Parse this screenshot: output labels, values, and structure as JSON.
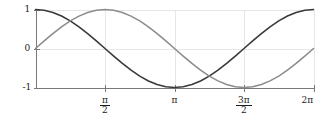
{
  "chart_data": {
    "type": "line",
    "title": "",
    "subtitle": "",
    "xlabel": "",
    "ylabel": "",
    "xlim": [
      0,
      6.283185307179586
    ],
    "ylim": [
      -1,
      1
    ],
    "grid": true,
    "legend": null,
    "x_tick_values": [
      0,
      1.5707963267948966,
      3.141592653589793,
      4.71238898038469,
      6.283185307179586
    ],
    "x_tick_labels": [
      "",
      "π/2",
      "π",
      "3π/2",
      "2π"
    ],
    "y_tick_values": [
      1,
      0,
      -1
    ],
    "y_tick_labels": [
      "1",
      "0",
      "-1"
    ],
    "series": [
      {
        "name": "cos(x)",
        "color": "#3a3a3a",
        "linewidth": 1.6,
        "x": [
          0,
          0.19634954,
          0.39269908,
          0.58904862,
          0.78539816,
          0.9817477,
          1.17809725,
          1.37444679,
          1.57079633,
          1.76714587,
          1.96349541,
          2.15984495,
          2.35619449,
          2.55254403,
          2.74889357,
          2.94524311,
          3.14159265,
          3.33794219,
          3.53429174,
          3.73064128,
          3.92699082,
          4.12334036,
          4.3196899,
          4.51603944,
          4.71238898,
          4.90873852,
          5.10508806,
          5.3014376,
          5.49778714,
          5.69413668,
          5.89048623,
          6.08683577,
          6.28318531
        ],
        "y": [
          1.0,
          0.98078528,
          0.92387953,
          0.83146961,
          0.70710678,
          0.55557023,
          0.38268343,
          0.19509032,
          0.0,
          -0.19509032,
          -0.38268343,
          -0.55557023,
          -0.70710678,
          -0.83146961,
          -0.92387953,
          -0.98078528,
          -1.0,
          -0.98078528,
          -0.92387953,
          -0.83146961,
          -0.70710678,
          -0.55557023,
          -0.38268343,
          -0.19509032,
          0.0,
          0.19509032,
          0.38268343,
          0.55557023,
          0.70710678,
          0.83146961,
          0.92387953,
          0.98078528,
          1.0
        ]
      },
      {
        "name": "sin(x)",
        "color": "#8c8c8c",
        "linewidth": 1.5,
        "x": [
          0,
          0.19634954,
          0.39269908,
          0.58904862,
          0.78539816,
          0.9817477,
          1.17809725,
          1.37444679,
          1.57079633,
          1.76714587,
          1.96349541,
          2.15984495,
          2.35619449,
          2.55254403,
          2.74889357,
          2.94524311,
          3.14159265,
          3.33794219,
          3.53429174,
          3.73064128,
          3.92699082,
          4.12334036,
          4.3196899,
          4.51603944,
          4.71238898,
          4.90873852,
          5.10508806,
          5.3014376,
          5.49778714,
          5.69413668,
          5.89048623,
          6.08683577,
          6.28318531
        ],
        "y": [
          0.0,
          0.19509032,
          0.38268343,
          0.55557023,
          0.70710678,
          0.83146961,
          0.92387953,
          0.98078528,
          1.0,
          0.98078528,
          0.92387953,
          0.83146961,
          0.70710678,
          0.55557023,
          0.38268343,
          0.19509032,
          0.0,
          -0.19509032,
          -0.38268343,
          -0.55557023,
          -0.70710678,
          -0.83146961,
          -0.92387953,
          -0.98078528,
          -1.0,
          -0.98078528,
          -0.92387953,
          -0.83146961,
          -0.70710678,
          -0.55557023,
          -0.38268343,
          -0.19509032,
          0.0
        ]
      }
    ],
    "annotations": []
  },
  "axis_labels": {
    "y_top": "1",
    "y_mid": "0",
    "y_bottom": "-1",
    "x_half_pi_num": "π",
    "x_half_pi_den": "2",
    "x_pi": "π",
    "x_three_half_pi_num": "3π",
    "x_three_half_pi_den": "2",
    "x_two_pi": "2π"
  },
  "style": {
    "axis_color": "#7a7a7a",
    "grid_color": "#e6e6e6",
    "text_color": "#1a1a1a",
    "background": "#ffffff",
    "cos_color": "#3a3a3a",
    "sin_color": "#8c8c8c"
  }
}
